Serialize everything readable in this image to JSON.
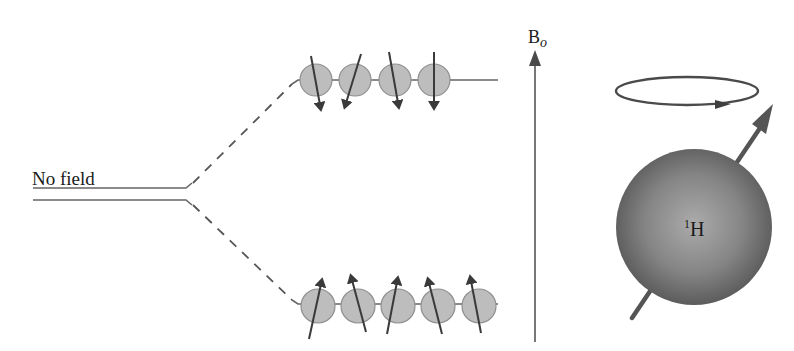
{
  "diagram": {
    "labels": {
      "no_field": "No field",
      "field_symbol": "B",
      "field_subscript": "o",
      "nucleus_mass": "1",
      "nucleus_symbol": "H"
    },
    "upper_level": {
      "spin_count": 4,
      "spin_direction": "down"
    },
    "lower_level": {
      "spin_count": 5,
      "spin_direction": "up"
    },
    "colors": {
      "line": "#555555",
      "spin_fill": "#bdbdbd",
      "spin_stroke": "#8a8a8a",
      "arrow": "#4a4a4a",
      "sphere_center": "#a8a8a8",
      "sphere_edge": "#5e5e5e"
    }
  }
}
